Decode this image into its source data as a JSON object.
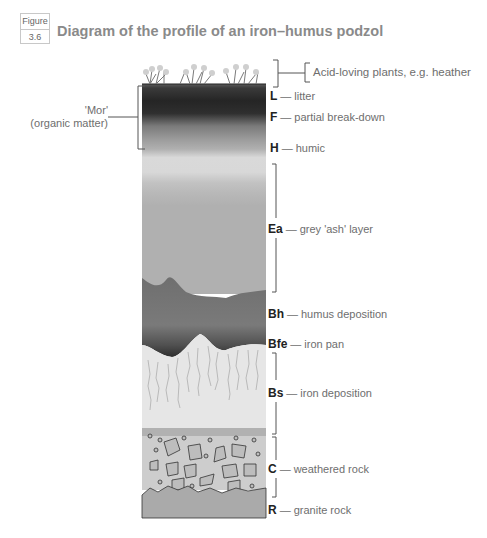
{
  "figure": {
    "badge_top": "Figure",
    "badge_num": "3.6",
    "title": "Diagram of the profile of an iron–humus podzol"
  },
  "side_label": {
    "line1": "'Mor'",
    "line2": "(organic matter)"
  },
  "plants_label": "Acid-loving plants, e.g. heather",
  "horizons": [
    {
      "code": "L",
      "desc": "litter"
    },
    {
      "code": "F",
      "desc": "partial break-down"
    },
    {
      "code": "H",
      "desc": "humic"
    },
    {
      "code": "Ea",
      "desc": "grey 'ash' layer"
    },
    {
      "code": "Bh",
      "desc": "humus deposition"
    },
    {
      "code": "Bfe",
      "desc": "iron pan"
    },
    {
      "code": "Bs",
      "desc": "iron deposition"
    },
    {
      "code": "C",
      "desc": "weathered rock"
    },
    {
      "code": "R",
      "desc": "granite rock"
    }
  ],
  "dash": "—",
  "colors": {
    "mor_dark": "#2a2a2a",
    "humic": "#8a8a8a",
    "ash": "#d6d6d6",
    "humus_dep": "#6e6e6e",
    "iron_pan": "#3c3c3c",
    "iron_dep": "#e4e4e4",
    "weathered": "#c8c8c8",
    "granite": "#a9a9a9"
  }
}
